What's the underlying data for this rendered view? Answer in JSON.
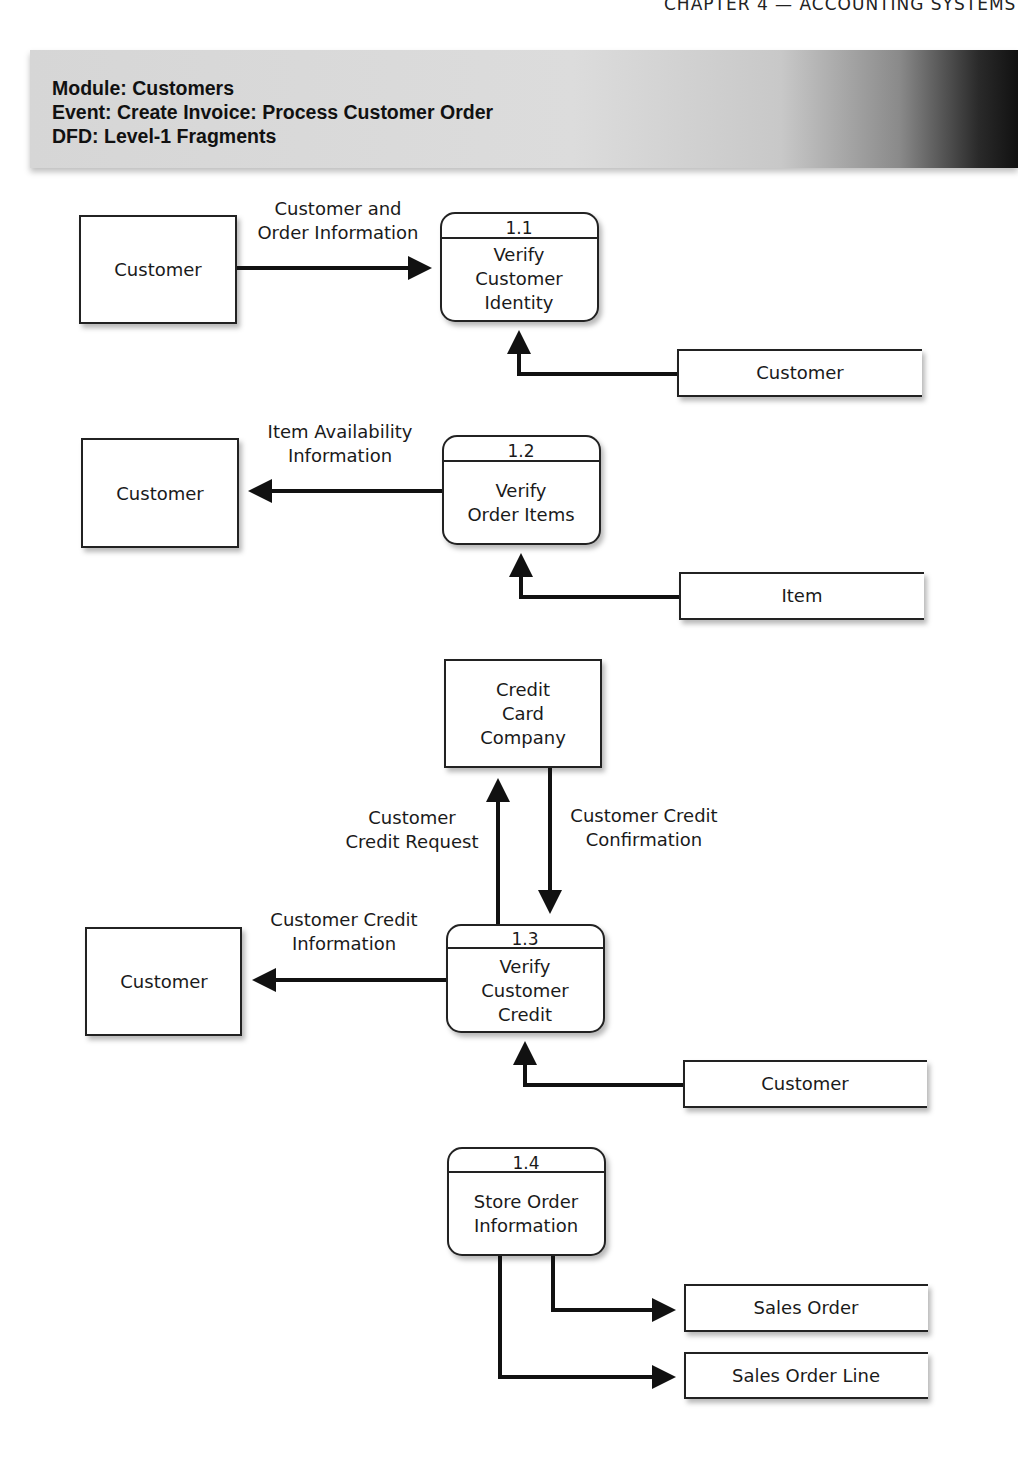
{
  "running_head": "CHAPTER 4 — ACCOUNTING SYSTEMS",
  "banner": {
    "module": "Module: Customers",
    "event": "Event: Create Invoice: Process Customer Order",
    "dfd": "DFD: Level-1 Fragments"
  },
  "fragments": [
    {
      "process": {
        "number": "1.1",
        "label_lines": [
          "Verify",
          "Customer",
          "Identity"
        ]
      },
      "entity": "Customer",
      "entity_flow": {
        "label_lines": [
          "Customer and",
          "Order Information"
        ],
        "direction": "to-process"
      },
      "data_store": "Customer"
    },
    {
      "process": {
        "number": "1.2",
        "label_lines": [
          "Verify",
          "Order Items"
        ]
      },
      "entity": "Customer",
      "entity_flow": {
        "label_lines": [
          "Item Availability",
          "Information"
        ],
        "direction": "to-entity"
      },
      "data_store": "Item"
    },
    {
      "process": {
        "number": "1.3",
        "label_lines": [
          "Verify",
          "Customer",
          "Credit"
        ]
      },
      "entity": "Customer",
      "entity_flow": {
        "label_lines": [
          "Customer Credit",
          "Information"
        ],
        "direction": "to-entity"
      },
      "external": {
        "label_lines": [
          "Credit",
          "Card",
          "Company"
        ]
      },
      "request_flow": {
        "label_lines": [
          "Customer",
          "Credit Request"
        ]
      },
      "confirm_flow": {
        "label_lines": [
          "Customer Credit",
          "Confirmation"
        ]
      },
      "data_store": "Customer"
    },
    {
      "process": {
        "number": "1.4",
        "label_lines": [
          "Store Order",
          "Information"
        ]
      },
      "data_stores": [
        "Sales Order",
        "Sales Order Line"
      ]
    }
  ]
}
